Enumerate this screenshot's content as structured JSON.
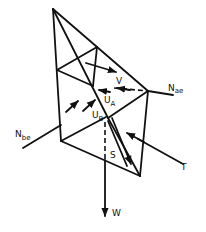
{
  "diagram": {
    "type": "free-body force diagram of wedge/tetrahedral block",
    "labels": {
      "V": "V",
      "N_ae_main": "N",
      "N_ae_sub": "ae",
      "U_A_main": "U",
      "U_A_sub": "A",
      "U_B_main": "U",
      "U_B_sub": "B",
      "N_be_main": "N",
      "N_be_sub": "be",
      "S": "S",
      "T": "T",
      "W": "W"
    },
    "forces": [
      "V",
      "N_ae",
      "U_A",
      "U_B",
      "N_be",
      "S",
      "T",
      "W"
    ],
    "colors": {
      "stroke": "#111111",
      "background": "#ffffff"
    }
  }
}
